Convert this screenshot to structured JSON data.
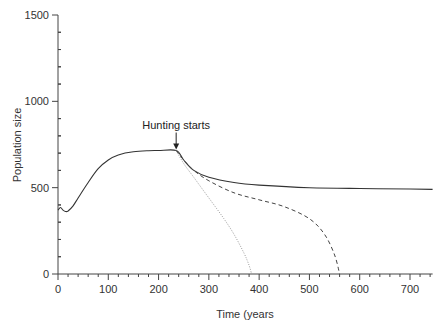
{
  "chart_data": {
    "type": "line",
    "title": "",
    "xlabel": "Time (years",
    "ylabel": "Population size",
    "xlim": [
      0,
      745
    ],
    "ylim": [
      0,
      1500
    ],
    "xticks": [
      0,
      100,
      200,
      300,
      400,
      500,
      600,
      700
    ],
    "yticks": [
      0,
      500,
      1000,
      1500
    ],
    "x_minor_step": 20,
    "y_minor_step": 100,
    "grid": false,
    "legend": null,
    "annotations": [
      {
        "text": "Hunting starts",
        "x": 235,
        "y": 715,
        "arrow": true
      }
    ],
    "series": [
      {
        "name": "solid",
        "style": "solid",
        "x": [
          0,
          5,
          10,
          15,
          20,
          30,
          40,
          60,
          80,
          100,
          120,
          150,
          180,
          200,
          235,
          250,
          270,
          300,
          350,
          400,
          500,
          600,
          700,
          745
        ],
        "y": [
          370,
          385,
          370,
          362,
          365,
          395,
          440,
          530,
          610,
          660,
          690,
          708,
          714,
          715,
          715,
          660,
          600,
          560,
          530,
          515,
          500,
          495,
          492,
          490
        ]
      },
      {
        "name": "dashed",
        "style": "dashed",
        "x": [
          235,
          250,
          270,
          300,
          350,
          400,
          450,
          500,
          530,
          550,
          560
        ],
        "y": [
          715,
          660,
          600,
          540,
          470,
          430,
          390,
          320,
          230,
          110,
          0
        ]
      },
      {
        "name": "dotted",
        "style": "dotted",
        "x": [
          235,
          250,
          270,
          300,
          330,
          350,
          370,
          380,
          385
        ],
        "y": [
          715,
          640,
          560,
          440,
          320,
          230,
          120,
          50,
          0
        ]
      }
    ]
  }
}
